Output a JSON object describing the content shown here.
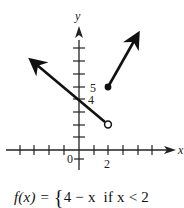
{
  "graph": {
    "axis_labels": {
      "x": "x",
      "y": "y"
    },
    "origin_label": "0",
    "x_tick_label": "2",
    "y_tick_labels": [
      "4",
      "5"
    ],
    "x_ticks": [
      -4,
      -3,
      -2,
      -1,
      1,
      2,
      3,
      4,
      5,
      6
    ],
    "y_ticks": [
      1,
      2,
      3,
      4,
      5,
      6,
      7,
      8
    ],
    "pieces": [
      {
        "expr": "4 - x",
        "condition": "x < 2",
        "endpoint": [
          2,
          2
        ],
        "endpoint_style": "open",
        "direction": "left-up arrow"
      },
      {
        "expr": "x + 3",
        "condition": "x ≥ 2",
        "endpoint": [
          2,
          5
        ],
        "endpoint_style": "closed",
        "direction": "right-up arrow"
      }
    ],
    "colors": {
      "line": "#111111",
      "axis": "#222222",
      "background": "#ffffff"
    }
  },
  "formula": {
    "lhs": "f(x) = ",
    "brace": "{",
    "row1_expr": "4 − x",
    "row1_cond": "if x < 2",
    "row2_partial": "x + 3  if x ≥ 2"
  }
}
